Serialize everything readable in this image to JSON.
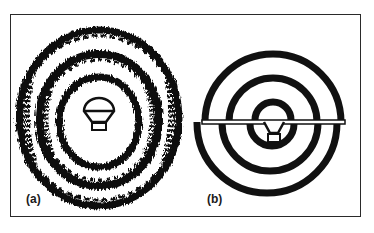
{
  "figure": {
    "panels": [
      {
        "id": "a",
        "label": "(a)",
        "description": "Concentric rings around a light bulb, smeared / blurred appearance"
      },
      {
        "id": "b",
        "label": "(b)",
        "description": "Concentric rings around a light bulb, split horizontally with lower half offset"
      }
    ],
    "colors": {
      "ink": "#111111",
      "background": "#ffffff",
      "frame": "#2a2a2a"
    }
  }
}
